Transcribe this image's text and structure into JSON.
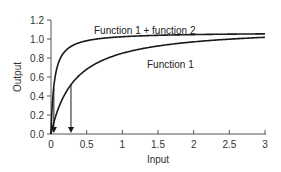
{
  "chart_data": {
    "type": "line",
    "title": "",
    "xlabel": "Input",
    "ylabel": "Output",
    "xlim": [
      0,
      3
    ],
    "ylim": [
      0,
      1.2
    ],
    "xticks": [
      0,
      0.5,
      1,
      1.5,
      2,
      2.5,
      3
    ],
    "xtick_labels": [
      "0",
      "0.5",
      "1",
      "1.5",
      "2",
      "2.5",
      "3"
    ],
    "yticks": [
      0,
      0.2,
      0.4,
      0.6,
      0.8,
      1.0,
      1.2
    ],
    "ytick_labels": [
      "0.0",
      "0.2",
      "0.4",
      "0.6",
      "0.8",
      "1.0",
      "1.2"
    ],
    "grid": false,
    "legend": "none (inline curve labels)",
    "series": [
      {
        "name": "Function 1 + function 2",
        "x": [
          0,
          0.02,
          0.04,
          0.1,
          0.2,
          0.3,
          0.5,
          0.75,
          1.0,
          1.5,
          2.0,
          2.5,
          3.0
        ],
        "values": [
          0,
          0.31,
          0.48,
          0.71,
          0.86,
          0.92,
          0.97,
          1.0,
          1.02,
          1.03,
          1.04,
          1.05,
          1.05
        ]
      },
      {
        "name": "Function 1",
        "x": [
          0,
          0.05,
          0.1,
          0.2,
          0.28,
          0.4,
          0.6,
          0.8,
          1.0,
          1.5,
          2.0,
          2.5,
          3.0
        ],
        "values": [
          0,
          0.15,
          0.26,
          0.4,
          0.52,
          0.62,
          0.73,
          0.8,
          0.85,
          0.93,
          0.97,
          1.0,
          1.02
        ]
      }
    ],
    "annotations": [
      {
        "text": "Function 1 + function 2",
        "x": 0.95,
        "y": 1.1
      },
      {
        "text": "Function 1",
        "x": 1.3,
        "y": 0.76
      },
      {
        "type": "arrow",
        "from": [
          0.04,
          0.48
        ],
        "to": [
          0.04,
          0.0
        ],
        "note": "EC50 of Function 1 + function 2"
      },
      {
        "type": "arrow",
        "from": [
          0.28,
          0.52
        ],
        "to": [
          0.28,
          0.0
        ],
        "note": "EC50 of Function 1"
      }
    ]
  },
  "labels": {
    "upper_curve": "Function 1 + function 2",
    "lower_curve": "Function 1",
    "x_axis": "Input",
    "y_axis": "Output"
  }
}
